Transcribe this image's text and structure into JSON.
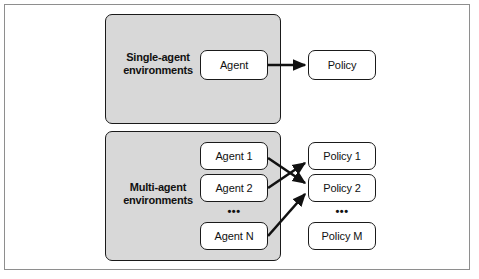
{
  "figure": {
    "type": "block-diagram"
  },
  "colors": {
    "panel_fill": "#d8d8d8",
    "node_fill": "#ffffff",
    "stroke": "#1a1a1a",
    "frame_border": "#8e8e8e",
    "text": "#111111"
  },
  "panels": [
    {
      "id": "single",
      "label_line1": "Single-agent",
      "label_line2": "environments"
    },
    {
      "id": "multi",
      "label_line1": "Multi-agent",
      "label_line2": "environments"
    }
  ],
  "nodes": {
    "agent": "Agent",
    "policy": "Policy",
    "agent_1": "Agent 1",
    "agent_2": "Agent 2",
    "agent_n": "Agent N",
    "policy_1": "Policy 1",
    "policy_2": "Policy 2",
    "policy_m": "Policy M"
  },
  "ellipses": {
    "agents": "•••",
    "policies": "•••"
  },
  "edges": [
    {
      "from": "Agent",
      "to": "Policy"
    },
    {
      "from": "Agent 1",
      "to": "Policy 2"
    },
    {
      "from": "Agent 2",
      "to": "Policy 1"
    },
    {
      "from": "Agent N",
      "to": "Policy 2"
    }
  ]
}
